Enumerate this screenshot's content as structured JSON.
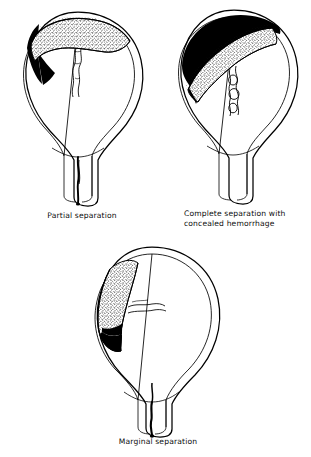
{
  "document": {
    "title": "Placental abruption types",
    "background_color": "#ffffff",
    "ink_color": "#000000"
  },
  "figures": [
    {
      "id": "partial",
      "caption": "Partial separation",
      "caption_lines": [
        "Partial separation"
      ],
      "caption_align": "center",
      "structures": [
        "uterus-outline",
        "uterine-wall",
        "placenta-stippled",
        "retroplacental-hemorrhage-black",
        "umbilical-cord",
        "amniotic-cavity",
        "cervical-canal",
        "vaginal-bleeding-track"
      ],
      "placenta_position": "fundal",
      "hemorrhage_type": "revealed",
      "hemorrhage_extent": "partial"
    },
    {
      "id": "complete",
      "caption": "Complete separation with concealed hemorrhage",
      "caption_lines": [
        "Complete separation with",
        "concealed hemorrhage"
      ],
      "caption_align": "left",
      "structures": [
        "uterus-outline",
        "uterine-wall",
        "placenta-stippled",
        "concealed-hemorrhage-black",
        "umbilical-cord",
        "amniotic-cavity",
        "cervical-canal"
      ],
      "placenta_position": "fundal-oblique",
      "hemorrhage_type": "concealed",
      "hemorrhage_extent": "complete"
    },
    {
      "id": "marginal",
      "caption": "Marginal separation",
      "caption_lines": [
        "Marginal separation"
      ],
      "caption_align": "center",
      "structures": [
        "uterus-outline",
        "uterine-wall",
        "placenta-stippled",
        "marginal-hemorrhage-black",
        "umbilical-cord",
        "amniotic-cavity",
        "cervical-canal",
        "vaginal-bleeding-track"
      ],
      "placenta_position": "lateral-left",
      "hemorrhage_type": "revealed",
      "hemorrhage_extent": "marginal"
    }
  ]
}
